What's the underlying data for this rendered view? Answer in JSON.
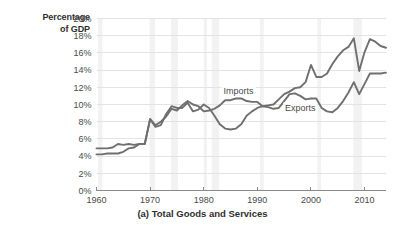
{
  "axis_title_line1": "Percentage",
  "axis_title_line2": "of GDP",
  "caption": "(a) Total Goods and Services",
  "colors": {
    "imports_line": "#6f6f6f",
    "exports_line": "#6f6f6f",
    "gridline": "#e3e3e3",
    "axis": "#8a8a8a",
    "recession_band": "#f2f2f2",
    "text": "#4a4a4a"
  },
  "chart_data": {
    "type": "line",
    "title": "(a) Total Goods and Services",
    "xlabel": "",
    "ylabel": "Percentage of GDP",
    "xlim": [
      1960,
      2014
    ],
    "ylim": [
      0,
      20
    ],
    "grid": "horizontal",
    "legend": "inline-annotations",
    "ytick_labels": [
      "0%",
      "2%",
      "4%",
      "6%",
      "8%",
      "10%",
      "12%",
      "14%",
      "16%",
      "18%",
      "20%"
    ],
    "ytick_values": [
      0,
      2,
      4,
      6,
      8,
      10,
      12,
      14,
      16,
      18,
      20
    ],
    "xtick_labels": [
      "1960",
      "1970",
      "1980",
      "1990",
      "2000",
      "2010"
    ],
    "xtick_values": [
      1960,
      1970,
      1980,
      1990,
      2000,
      2010
    ],
    "x": [
      1960,
      1961,
      1962,
      1963,
      1964,
      1965,
      1966,
      1967,
      1968,
      1969,
      1970,
      1971,
      1972,
      1973,
      1974,
      1975,
      1976,
      1977,
      1978,
      1979,
      1980,
      1981,
      1982,
      1983,
      1984,
      1985,
      1986,
      1987,
      1988,
      1989,
      1990,
      1991,
      1992,
      1993,
      1994,
      1995,
      1996,
      1997,
      1998,
      1999,
      2000,
      2001,
      2002,
      2003,
      2004,
      2005,
      2006,
      2007,
      2008,
      2009,
      2010,
      2011,
      2012,
      2013,
      2014
    ],
    "series": [
      {
        "name": "Imports",
        "values": [
          4.2,
          4.2,
          4.3,
          4.3,
          4.3,
          4.5,
          4.9,
          5.0,
          5.4,
          5.4,
          8.3,
          7.6,
          8.0,
          8.6,
          9.5,
          9.3,
          9.9,
          10.4,
          10.0,
          9.8,
          9.2,
          9.3,
          9.5,
          9.9,
          10.5,
          10.5,
          10.7,
          10.7,
          10.4,
          10.3,
          10.3,
          9.8,
          9.9,
          10.0,
          10.6,
          11.2,
          11.5,
          11.9,
          12.0,
          12.6,
          14.6,
          13.2,
          13.2,
          13.6,
          14.7,
          15.6,
          16.3,
          16.7,
          17.7,
          13.9,
          16.1,
          17.6,
          17.3,
          16.8,
          16.6
        ],
        "color": "#6f6f6f"
      },
      {
        "name": "Exports",
        "values": [
          4.9,
          4.9,
          4.9,
          5.0,
          5.4,
          5.3,
          5.4,
          5.3,
          5.4,
          5.4,
          8.3,
          7.4,
          7.6,
          8.9,
          9.8,
          9.6,
          9.6,
          10.2,
          9.2,
          9.4,
          10.0,
          9.6,
          8.7,
          7.7,
          7.2,
          7.1,
          7.2,
          7.7,
          8.7,
          9.2,
          9.6,
          9.8,
          9.7,
          9.5,
          9.6,
          10.4,
          11.2,
          11.3,
          11.0,
          10.6,
          10.7,
          10.7,
          9.6,
          9.2,
          9.1,
          9.6,
          10.4,
          11.4,
          12.6,
          11.2,
          12.4,
          13.6,
          13.6,
          13.6,
          13.7
        ],
        "color": "#6f6f6f"
      }
    ],
    "annotations": [
      {
        "text": "Imports",
        "x": 1986.5,
        "y": 11.6,
        "series": "Imports"
      },
      {
        "text": "Exports",
        "x": 1998.0,
        "y": 9.6,
        "series": "Exports"
      }
    ],
    "recession_bands": [
      [
        1960.3,
        1961.1
      ],
      [
        1969.9,
        1970.9
      ],
      [
        1973.9,
        1975.2
      ],
      [
        1980.0,
        1980.6
      ],
      [
        1981.5,
        1982.9
      ],
      [
        1990.5,
        1991.2
      ],
      [
        2001.2,
        2001.9
      ],
      [
        2007.9,
        2009.5
      ]
    ]
  }
}
